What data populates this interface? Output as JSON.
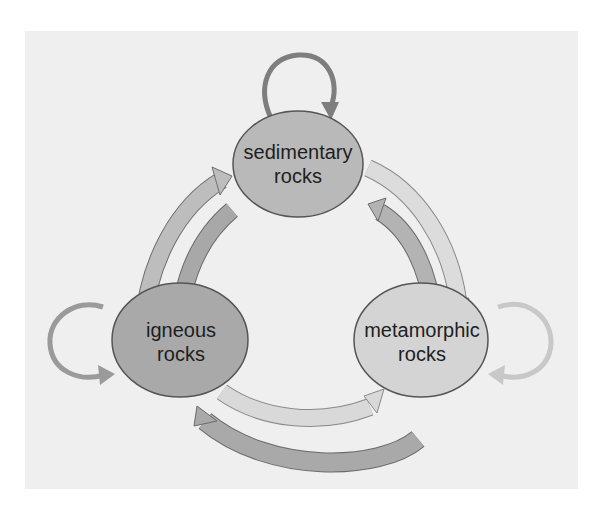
{
  "diagram": {
    "title": "",
    "nodes": [
      {
        "id": "sedimentary",
        "line1": "sedimentary",
        "line2": "rocks",
        "fill": "#b9b9b9"
      },
      {
        "id": "igneous",
        "line1": "igneous",
        "line2": "rocks",
        "fill": "#a9a9a9"
      },
      {
        "id": "metamorphic",
        "line1": "metamorphic",
        "line2": "rocks",
        "fill": "#d4d4d4"
      }
    ],
    "edges": [
      {
        "from": "igneous",
        "to": "sedimentary",
        "shade": "#bdbdbd"
      },
      {
        "from": "sedimentary",
        "to": "igneous",
        "shade": "#a8a8a8"
      },
      {
        "from": "sedimentary",
        "to": "metamorphic",
        "shade": "#dcdcdc"
      },
      {
        "from": "metamorphic",
        "to": "sedimentary",
        "shade": "#b3b3b3"
      },
      {
        "from": "igneous",
        "to": "metamorphic",
        "shade": "#d9d9d9"
      },
      {
        "from": "metamorphic",
        "to": "igneous",
        "shade": "#a9a9a9"
      },
      {
        "from": "sedimentary",
        "to": "sedimentary",
        "shade": "#7e7e7e"
      },
      {
        "from": "igneous",
        "to": "igneous",
        "shade": "#9a9a9a"
      },
      {
        "from": "metamorphic",
        "to": "metamorphic",
        "shade": "#c8c8c8"
      }
    ],
    "colors": {
      "panel": "#efefef",
      "outline": "#555555",
      "text": "#1e1e1e"
    }
  }
}
